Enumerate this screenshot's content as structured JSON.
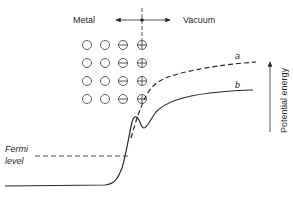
{
  "diagram": {
    "type": "potential-energy-diagram",
    "labels": {
      "metal": "Metal",
      "vacuum": "Vacuum",
      "fermi_line1": "Fermi",
      "fermi_line2": "level",
      "curve_a": "a",
      "curve_b": "b",
      "axis": "Potential energy"
    },
    "lattice": {
      "rows": 4,
      "columns": [
        {
          "symbol": "neutral"
        },
        {
          "symbol": "neutral"
        },
        {
          "symbol": "minus"
        },
        {
          "symbol": "plus"
        }
      ]
    },
    "curves": [
      {
        "id": "a",
        "style": "dashed",
        "description": "image potential without surface dipole"
      },
      {
        "id": "b",
        "style": "solid",
        "description": "potential energy with surface dipole barrier"
      }
    ],
    "colors": {
      "ink": "#2a2a2a",
      "background": "#ffffff"
    }
  }
}
